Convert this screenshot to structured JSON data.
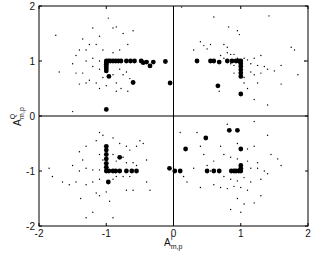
{
  "chart_data": {
    "type": "scatter",
    "title": "",
    "xlabel": "A^I_{m,p}",
    "ylabel": "A^Q_{m,p}",
    "xlabel_main": "A",
    "xlabel_sup": "I",
    "xlabel_sub": "m,p",
    "ylabel_main": "A",
    "ylabel_sup": "Q",
    "ylabel_sub": "m,p",
    "xlim": [
      -2,
      2
    ],
    "ylim": [
      -2,
      2
    ],
    "xticks": [
      -2,
      -1,
      0,
      1,
      2
    ],
    "yticks": [
      -2,
      -1,
      0,
      1,
      2
    ],
    "xtick_labels": [
      "-2",
      "-1",
      "0",
      "1",
      "2"
    ],
    "ytick_labels": [
      "-2",
      "-1",
      "0",
      "1",
      "2"
    ],
    "grid": false,
    "crosshair_at_origin": true,
    "legend": null,
    "series": [
      {
        "name": "large-markers",
        "marker": "filled-circle-large",
        "points": [
          [
            -1.0,
            1.0
          ],
          [
            -1.0,
            0.97
          ],
          [
            -1.0,
            0.94
          ],
          [
            -1.0,
            0.9
          ],
          [
            -1.0,
            0.86
          ],
          [
            -1.0,
            0.82
          ],
          [
            -0.97,
            1.0
          ],
          [
            -0.94,
            1.0
          ],
          [
            -0.9,
            1.0
          ],
          [
            -0.86,
            1.0
          ],
          [
            -0.82,
            1.0
          ],
          [
            -0.78,
            1.0
          ],
          [
            -0.7,
            1.0
          ],
          [
            -0.64,
            1.0
          ],
          [
            -0.58,
            1.0
          ],
          [
            -0.48,
            1.0
          ],
          [
            -0.45,
            0.97
          ],
          [
            -0.4,
            0.98
          ],
          [
            -0.35,
            0.91
          ],
          [
            -0.3,
            0.98
          ],
          [
            -0.12,
            0.99
          ],
          [
            -0.05,
            0.6
          ],
          [
            -0.96,
            0.72
          ],
          [
            -0.6,
            0.61
          ],
          [
            -1.0,
            0.12
          ],
          [
            1.0,
            1.0
          ],
          [
            1.0,
            0.95
          ],
          [
            1.0,
            0.9
          ],
          [
            1.0,
            0.84
          ],
          [
            1.0,
            0.78
          ],
          [
            1.0,
            0.72
          ],
          [
            0.97,
            1.0
          ],
          [
            0.93,
            1.0
          ],
          [
            0.87,
            1.0
          ],
          [
            0.8,
            1.0
          ],
          [
            0.55,
            1.0
          ],
          [
            0.6,
            1.0
          ],
          [
            0.68,
            0.98
          ],
          [
            0.35,
            1.0
          ],
          [
            0.66,
            0.55
          ],
          [
            1.0,
            0.4
          ],
          [
            -1.0,
            -0.55
          ],
          [
            -1.0,
            -0.62
          ],
          [
            -1.0,
            -0.7
          ],
          [
            -1.0,
            -0.78
          ],
          [
            -1.0,
            -0.86
          ],
          [
            -1.0,
            -0.93
          ],
          [
            -1.0,
            -1.0
          ],
          [
            -0.96,
            -1.0
          ],
          [
            -0.9,
            -1.0
          ],
          [
            -0.86,
            -1.0
          ],
          [
            -0.8,
            -1.0
          ],
          [
            -0.7,
            -1.0
          ],
          [
            -0.62,
            -1.0
          ],
          [
            -0.55,
            -1.0
          ],
          [
            -0.8,
            -0.75
          ],
          [
            -0.06,
            -0.95
          ],
          [
            -0.97,
            -1.2
          ],
          [
            1.0,
            -1.0
          ],
          [
            1.0,
            -0.95
          ],
          [
            1.0,
            -0.9
          ],
          [
            0.97,
            -1.0
          ],
          [
            0.93,
            -1.0
          ],
          [
            0.9,
            -1.0
          ],
          [
            0.86,
            -1.0
          ],
          [
            0.68,
            -1.0
          ],
          [
            0.6,
            -1.0
          ],
          [
            0.5,
            -1.0
          ],
          [
            0.02,
            -1.0
          ],
          [
            0.1,
            -1.0
          ],
          [
            0.18,
            -0.6
          ],
          [
            0.48,
            -0.4
          ],
          [
            1.0,
            -0.6
          ],
          [
            0.83,
            -0.26
          ],
          [
            0.95,
            -0.26
          ]
        ]
      },
      {
        "name": "small-markers",
        "marker": "dot-small",
        "points": [
          [
            -1.75,
            1.47
          ],
          [
            -1.7,
            0.8
          ],
          [
            -0.97,
            1.78
          ],
          [
            -0.9,
            1.6
          ],
          [
            -0.85,
            1.62
          ],
          [
            -1.2,
            1.6
          ],
          [
            -1.1,
            1.45
          ],
          [
            -0.75,
            1.5
          ],
          [
            -0.68,
            1.3
          ],
          [
            -0.6,
            1.55
          ],
          [
            -1.35,
            1.4
          ],
          [
            -1.3,
            1.2
          ],
          [
            -1.25,
            1.3
          ],
          [
            -1.15,
            1.3
          ],
          [
            -1.4,
            1.2
          ],
          [
            -1.45,
            1.1
          ],
          [
            -1.2,
            1.05
          ],
          [
            -1.1,
            1.0
          ],
          [
            -1.3,
            1.0
          ],
          [
            -1.5,
            0.95
          ],
          [
            -1.45,
            0.78
          ],
          [
            -1.35,
            0.78
          ],
          [
            -1.2,
            0.9
          ],
          [
            -1.1,
            0.85
          ],
          [
            -1.25,
            0.65
          ],
          [
            -1.15,
            0.6
          ],
          [
            -1.05,
            0.7
          ],
          [
            -0.9,
            0.75
          ],
          [
            -0.8,
            0.85
          ],
          [
            -0.75,
            0.75
          ],
          [
            -1.3,
            0.6
          ],
          [
            -1.4,
            0.58
          ],
          [
            -1.0,
            0.55
          ],
          [
            -0.85,
            0.6
          ],
          [
            -0.7,
            0.8
          ],
          [
            -0.65,
            0.68
          ],
          [
            -0.78,
            0.5
          ],
          [
            -0.85,
            0.45
          ],
          [
            -0.68,
            0.45
          ],
          [
            -1.1,
            0.5
          ],
          [
            -1.5,
            0.08
          ],
          [
            -0.9,
            1.15
          ],
          [
            -0.8,
            1.2
          ],
          [
            -1.05,
            1.2
          ],
          [
            0.12,
            1.98
          ],
          [
            0.6,
            1.8
          ],
          [
            0.82,
            1.62
          ],
          [
            0.95,
            1.55
          ],
          [
            0.98,
            1.48
          ],
          [
            1.42,
            1.82
          ],
          [
            0.4,
            1.35
          ],
          [
            0.55,
            1.3
          ],
          [
            0.75,
            1.3
          ],
          [
            0.8,
            1.25
          ],
          [
            0.5,
            1.22
          ],
          [
            0.3,
            1.2
          ],
          [
            0.8,
            1.15
          ],
          [
            0.85,
            1.12
          ],
          [
            0.9,
            1.12
          ],
          [
            0.95,
            1.05
          ],
          [
            1.05,
            1.05
          ],
          [
            1.1,
            1.02
          ],
          [
            1.2,
            1.05
          ],
          [
            1.3,
            1.1
          ],
          [
            0.7,
            1.1
          ],
          [
            0.75,
            1.05
          ],
          [
            0.85,
            0.95
          ],
          [
            0.9,
            0.92
          ],
          [
            1.15,
            0.95
          ],
          [
            1.25,
            0.92
          ],
          [
            1.35,
            0.9
          ],
          [
            1.4,
            0.85
          ],
          [
            1.5,
            0.82
          ],
          [
            1.6,
            0.92
          ],
          [
            1.15,
            0.8
          ],
          [
            1.2,
            0.75
          ],
          [
            1.3,
            0.78
          ],
          [
            1.05,
            0.7
          ],
          [
            0.9,
            0.78
          ],
          [
            1.05,
            0.6
          ],
          [
            1.25,
            0.6
          ],
          [
            1.1,
            0.5
          ],
          [
            1.6,
            0.58
          ],
          [
            0.68,
            0.45
          ],
          [
            1.2,
            0.3
          ],
          [
            1.4,
            0.2
          ],
          [
            1.8,
            1.2
          ],
          [
            1.75,
            1.25
          ],
          [
            1.85,
            0.75
          ],
          [
            1.95,
            1.0
          ],
          [
            0.45,
            1.28
          ],
          [
            -1.15,
            -0.45
          ],
          [
            -1.05,
            -0.35
          ],
          [
            -1.1,
            -0.3
          ],
          [
            -0.9,
            -0.4
          ],
          [
            -0.8,
            -0.5
          ],
          [
            -0.55,
            -0.55
          ],
          [
            -1.3,
            -0.55
          ],
          [
            -0.65,
            -0.62
          ],
          [
            -1.4,
            -0.65
          ],
          [
            -1.1,
            -0.7
          ],
          [
            -0.9,
            -0.7
          ],
          [
            -0.75,
            -0.75
          ],
          [
            -1.05,
            -0.8
          ],
          [
            -0.85,
            -0.82
          ],
          [
            -0.7,
            -0.85
          ],
          [
            -0.6,
            -0.85
          ],
          [
            -0.55,
            -0.9
          ],
          [
            -1.35,
            -0.8
          ],
          [
            -1.5,
            -0.9
          ],
          [
            -1.4,
            -1.0
          ],
          [
            -1.3,
            -0.95
          ],
          [
            -1.2,
            -0.98
          ],
          [
            -1.1,
            -0.98
          ],
          [
            -0.85,
            -1.1
          ],
          [
            -0.9,
            -1.15
          ],
          [
            -0.75,
            -1.1
          ],
          [
            -0.65,
            -1.1
          ],
          [
            -1.1,
            -1.15
          ],
          [
            -1.2,
            -1.2
          ],
          [
            -1.3,
            -1.25
          ],
          [
            -1.8,
            -1.1
          ],
          [
            -1.65,
            -1.2
          ],
          [
            -1.55,
            -1.25
          ],
          [
            -1.45,
            -1.2
          ],
          [
            -0.6,
            -1.35
          ],
          [
            -0.7,
            -1.35
          ],
          [
            -1.0,
            -1.38
          ],
          [
            -1.15,
            -1.4
          ],
          [
            -0.4,
            -1.2
          ],
          [
            -0.35,
            -1.35
          ],
          [
            -1.38,
            -1.5
          ],
          [
            -1.1,
            -1.45
          ],
          [
            -0.95,
            -1.55
          ],
          [
            -1.2,
            -1.75
          ],
          [
            -1.3,
            -1.85
          ],
          [
            -0.9,
            -1.85
          ],
          [
            -0.5,
            -0.45
          ],
          [
            -0.7,
            -0.55
          ],
          [
            -0.4,
            -0.8
          ],
          [
            -0.45,
            -0.5
          ],
          [
            0.8,
            -0.15
          ],
          [
            0.35,
            -0.3
          ],
          [
            0.1,
            -0.3
          ],
          [
            1.2,
            -0.1
          ],
          [
            1.4,
            -0.35
          ],
          [
            0.4,
            -0.55
          ],
          [
            0.7,
            -0.55
          ],
          [
            0.95,
            -0.5
          ],
          [
            1.1,
            -0.6
          ],
          [
            1.2,
            -0.55
          ],
          [
            0.75,
            -0.7
          ],
          [
            0.85,
            -0.75
          ],
          [
            0.95,
            -0.78
          ],
          [
            1.1,
            -0.82
          ],
          [
            1.25,
            -0.85
          ],
          [
            0.6,
            -0.82
          ],
          [
            0.5,
            -0.9
          ],
          [
            1.15,
            -0.95
          ],
          [
            1.25,
            -0.95
          ],
          [
            1.35,
            -1.0
          ],
          [
            1.4,
            -1.05
          ],
          [
            1.6,
            -0.9
          ],
          [
            0.75,
            -1.1
          ],
          [
            0.85,
            -1.15
          ],
          [
            0.95,
            -1.18
          ],
          [
            1.05,
            -1.12
          ],
          [
            1.15,
            -1.2
          ],
          [
            1.3,
            -1.15
          ],
          [
            0.6,
            -1.25
          ],
          [
            0.7,
            -1.3
          ],
          [
            0.8,
            -1.32
          ],
          [
            0.9,
            -1.28
          ],
          [
            1.0,
            -1.3
          ],
          [
            1.1,
            -1.35
          ],
          [
            0.4,
            -1.3
          ],
          [
            0.2,
            -1.2
          ],
          [
            0.15,
            -1.1
          ],
          [
            0.55,
            -1.0
          ],
          [
            1.3,
            -1.45
          ],
          [
            0.95,
            -1.5
          ],
          [
            1.05,
            -1.6
          ],
          [
            1.2,
            -1.58
          ],
          [
            0.85,
            -1.7
          ],
          [
            1.0,
            -1.75
          ],
          [
            -1.85,
            -0.95
          ],
          [
            0.3,
            -0.95
          ],
          [
            0.45,
            -0.7
          ],
          [
            1.45,
            -0.7
          ],
          [
            1.55,
            -0.78
          ]
        ]
      }
    ]
  },
  "plot": {
    "frame_color": "#000000",
    "marker_color": "#000000",
    "background": "#ffffff"
  }
}
